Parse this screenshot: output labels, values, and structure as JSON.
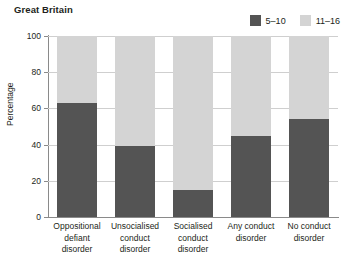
{
  "chart_data": {
    "type": "bar",
    "subtype": "stacked-100-percent",
    "title": "Great Britain",
    "xlabel": "",
    "ylabel": "Percentage",
    "ylim": [
      0,
      100
    ],
    "yticks": [
      0,
      20,
      40,
      60,
      80,
      100
    ],
    "grid": true,
    "legend_position": "top-right",
    "categories": [
      "Oppositional defiant disorder",
      "Unsocialised conduct disorder",
      "Socialised conduct disorder",
      "Any conduct disorder",
      "No conduct disorder"
    ],
    "category_lines": [
      [
        "Oppositional",
        "defiant",
        "disorder"
      ],
      [
        "Unsocialised",
        "conduct",
        "disorder"
      ],
      [
        "Socialised",
        "conduct",
        "disorder"
      ],
      [
        "Any conduct",
        "disorder"
      ],
      [
        "No conduct",
        "disorder"
      ]
    ],
    "series": [
      {
        "name": "5–10",
        "color": "#545454",
        "values": [
          63,
          39,
          15,
          45,
          54
        ]
      },
      {
        "name": "11–16",
        "color": "#d4d4d4",
        "values": [
          37,
          61,
          85,
          55,
          46
        ]
      }
    ]
  },
  "colors": {
    "dark": "#545454",
    "light": "#d4d4d4",
    "axis": "#8a8a8a",
    "grid": "#cfcfcf",
    "text": "#231f20",
    "background": "#ffffff"
  },
  "ytick_labels": [
    "0",
    "20",
    "40",
    "60",
    "80",
    "100"
  ],
  "legend": {
    "items": [
      {
        "label": "5–10",
        "color": "#545454"
      },
      {
        "label": "11–16",
        "color": "#d4d4d4"
      }
    ]
  }
}
